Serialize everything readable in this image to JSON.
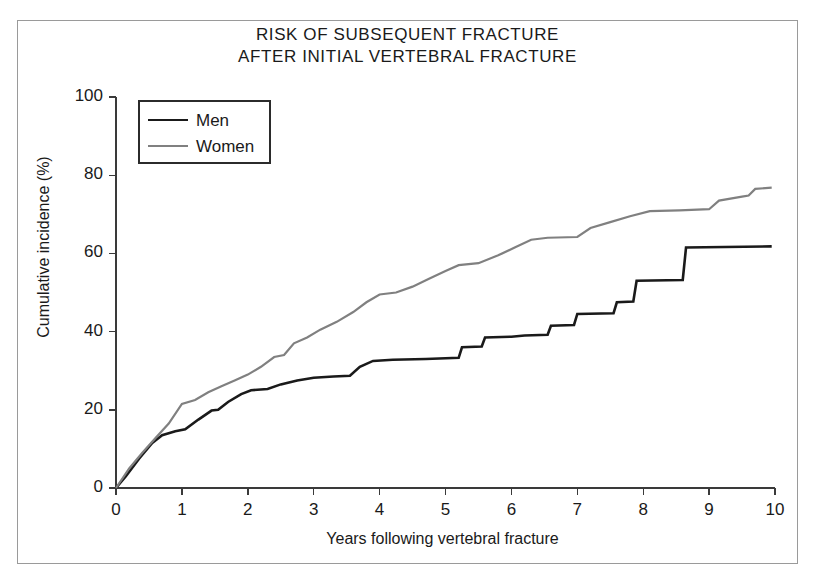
{
  "chart_data": {
    "type": "line",
    "title": "RISK OF SUBSEQUENT FRACTURE AFTER INITIAL VERTEBRAL FRACTURE",
    "title_line1": "RISK OF SUBSEQUENT FRACTURE",
    "title_line2": "AFTER INITIAL VERTEBRAL FRACTURE",
    "xlabel": "Years following vertebral fracture",
    "ylabel": "Cumulative incidence (%)",
    "xlim": [
      0,
      10
    ],
    "ylim": [
      0,
      100
    ],
    "xticks": [
      0,
      1,
      2,
      3,
      4,
      5,
      6,
      7,
      8,
      9,
      10
    ],
    "yticks": [
      0,
      20,
      40,
      60,
      80,
      100
    ],
    "xtick_labels": [
      "0",
      "1",
      "2",
      "3",
      "4",
      "5",
      "6",
      "7",
      "8",
      "9",
      "10"
    ],
    "ytick_labels": [
      "0",
      "20",
      "40",
      "60",
      "80",
      "100"
    ],
    "grid": false,
    "legend_position": "upper left",
    "series": [
      {
        "name": "Men",
        "color": "#1a1a1a",
        "linewidth": 2.6,
        "points": [
          [
            0.0,
            0.0
          ],
          [
            0.15,
            3.0
          ],
          [
            0.35,
            7.5
          ],
          [
            0.55,
            11.5
          ],
          [
            0.7,
            13.5
          ],
          [
            0.9,
            14.5
          ],
          [
            1.05,
            15.0
          ],
          [
            1.25,
            17.5
          ],
          [
            1.45,
            19.8
          ],
          [
            1.55,
            20.0
          ],
          [
            1.7,
            22.0
          ],
          [
            1.9,
            24.0
          ],
          [
            2.05,
            25.0
          ],
          [
            2.3,
            25.3
          ],
          [
            2.5,
            26.5
          ],
          [
            2.75,
            27.5
          ],
          [
            3.0,
            28.2
          ],
          [
            3.3,
            28.5
          ],
          [
            3.55,
            28.7
          ],
          [
            3.7,
            31.0
          ],
          [
            3.9,
            32.5
          ],
          [
            4.2,
            32.8
          ],
          [
            4.7,
            33.0
          ],
          [
            5.2,
            33.3
          ],
          [
            5.25,
            36.0
          ],
          [
            5.55,
            36.2
          ],
          [
            5.6,
            38.5
          ],
          [
            6.0,
            38.7
          ],
          [
            6.2,
            39.0
          ],
          [
            6.55,
            39.2
          ],
          [
            6.6,
            41.5
          ],
          [
            6.95,
            41.7
          ],
          [
            7.0,
            44.5
          ],
          [
            7.55,
            44.7
          ],
          [
            7.6,
            47.5
          ],
          [
            7.85,
            47.7
          ],
          [
            7.9,
            53.0
          ],
          [
            8.6,
            53.2
          ],
          [
            8.65,
            61.5
          ],
          [
            9.95,
            61.8
          ]
        ]
      },
      {
        "name": "Women",
        "color": "#808080",
        "linewidth": 2.2,
        "points": [
          [
            0.0,
            0.0
          ],
          [
            0.2,
            5.0
          ],
          [
            0.4,
            9.0
          ],
          [
            0.6,
            12.8
          ],
          [
            0.8,
            16.5
          ],
          [
            1.0,
            21.5
          ],
          [
            1.2,
            22.5
          ],
          [
            1.4,
            24.5
          ],
          [
            1.6,
            26.0
          ],
          [
            1.8,
            27.5
          ],
          [
            2.0,
            29.0
          ],
          [
            2.2,
            31.0
          ],
          [
            2.4,
            33.5
          ],
          [
            2.55,
            34.0
          ],
          [
            2.7,
            37.0
          ],
          [
            2.9,
            38.5
          ],
          [
            3.1,
            40.5
          ],
          [
            3.35,
            42.5
          ],
          [
            3.6,
            45.0
          ],
          [
            3.8,
            47.5
          ],
          [
            4.0,
            49.5
          ],
          [
            4.25,
            50.0
          ],
          [
            4.5,
            51.5
          ],
          [
            4.75,
            53.5
          ],
          [
            5.0,
            55.5
          ],
          [
            5.2,
            57.0
          ],
          [
            5.5,
            57.5
          ],
          [
            5.8,
            59.5
          ],
          [
            6.05,
            61.5
          ],
          [
            6.3,
            63.5
          ],
          [
            6.55,
            64.0
          ],
          [
            7.0,
            64.2
          ],
          [
            7.2,
            66.5
          ],
          [
            7.5,
            68.0
          ],
          [
            7.8,
            69.5
          ],
          [
            8.1,
            70.8
          ],
          [
            8.55,
            71.0
          ],
          [
            9.0,
            71.3
          ],
          [
            9.15,
            73.5
          ],
          [
            9.5,
            74.5
          ],
          [
            9.6,
            74.8
          ],
          [
            9.7,
            76.5
          ],
          [
            9.95,
            76.8
          ]
        ]
      }
    ],
    "legend_entries": [
      {
        "label": "Men",
        "color": "#1a1a1a"
      },
      {
        "label": "Women",
        "color": "#808080"
      }
    ]
  }
}
